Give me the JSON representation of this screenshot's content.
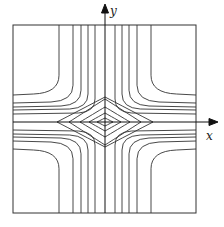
{
  "figure": {
    "type": "contour-plot",
    "frame": {
      "x0": 13,
      "y0": 25,
      "x1": 196,
      "y1": 213
    },
    "origin": {
      "x": 105,
      "y": 122
    },
    "axes": {
      "x_label": "x",
      "y_label": "y",
      "x_arrow_end": 218,
      "y_arrow_end": 4
    },
    "stroke_color": "#333333",
    "closed_loops": [
      {
        "rx": 8,
        "ry": 4
      },
      {
        "rx": 16,
        "ry": 9
      },
      {
        "rx": 25,
        "ry": 15
      },
      {
        "rx": 36,
        "ry": 23
      },
      {
        "rx": 48,
        "ry": 25
      }
    ],
    "hyperbolic_offsets": [
      {
        "dx": 10,
        "dy": 8
      },
      {
        "dx": 17,
        "dy": 12
      },
      {
        "dx": 24,
        "dy": 15
      },
      {
        "dx": 32,
        "dy": 19
      },
      {
        "dx": 46,
        "dy": 27
      }
    ]
  },
  "chart_data": {
    "type": "contour",
    "title": "",
    "xlabel": "x",
    "ylabel": "y",
    "closed_contour_count": 5,
    "open_contour_count_per_quadrant": 5,
    "vertical_line_positions_top_edge": [
      60,
      71,
      79,
      86,
      94,
      114,
      121,
      128,
      137,
      151
    ],
    "horizontal_line_positions_left_edge": [
      96,
      103,
      107,
      111,
      114,
      126,
      130,
      134,
      138,
      144
    ]
  }
}
